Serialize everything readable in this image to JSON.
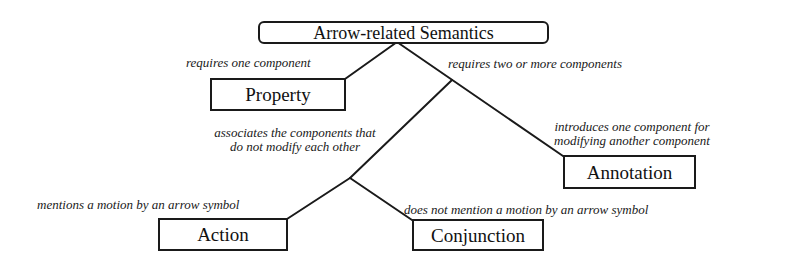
{
  "diagram": {
    "root": {
      "label": "Arrow-related Semantics"
    },
    "nodes": {
      "property": {
        "label": "Property"
      },
      "annotation": {
        "label": "Annotation"
      },
      "action": {
        "label": "Action"
      },
      "conjunction": {
        "label": "Conjunction"
      }
    },
    "edges": {
      "root_to_property": {
        "label": "requires one component"
      },
      "root_to_multi": {
        "label": "requires two or more components"
      },
      "multi_to_annotation": {
        "line1": "introduces one component for",
        "line2": "modifying another component"
      },
      "multi_to_associative": {
        "line1": "associates the components that",
        "line2": "do not modify each other"
      },
      "assoc_to_action": {
        "label": "mentions a motion by an arrow symbol"
      },
      "assoc_to_conjunction": {
        "label": "does not mention a motion by an arrow symbol"
      }
    },
    "colors": {
      "line": "#1a1a1a",
      "text": "#111111",
      "background": "#ffffff"
    }
  }
}
